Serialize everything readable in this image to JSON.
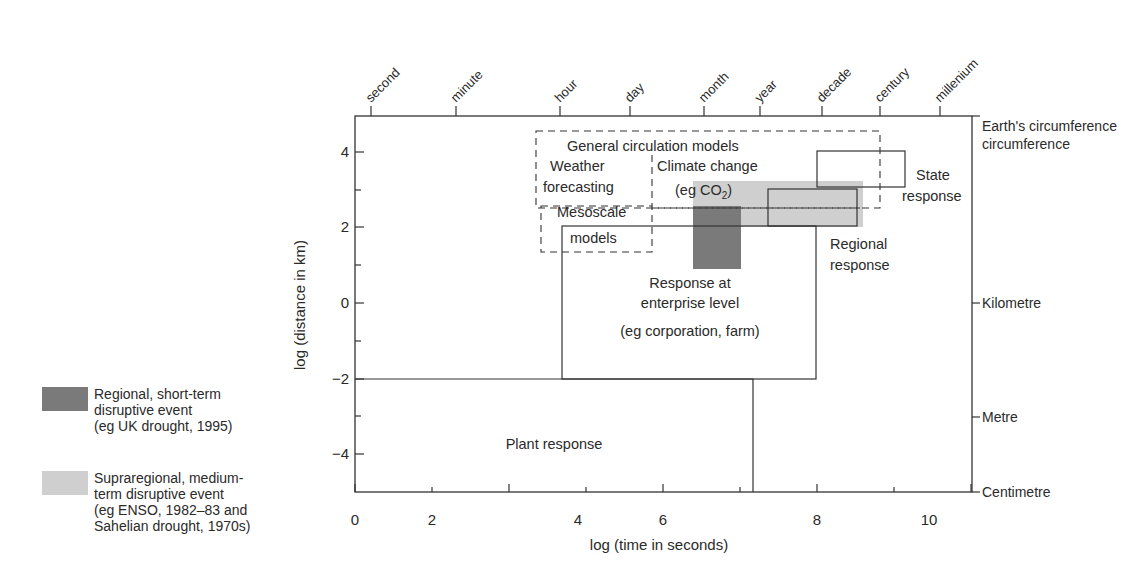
{
  "diagram": {
    "type": "scale-diagram",
    "x_axis": {
      "label": "log (time in seconds)",
      "ticks": [
        "0",
        "2",
        "4",
        "6",
        "8",
        "10"
      ],
      "top_labels": [
        "second",
        "minute",
        "hour",
        "day",
        "month",
        "year",
        "decade",
        "century",
        "millenium"
      ]
    },
    "y_axis": {
      "label": "log (distance in km)",
      "ticks": [
        "4",
        "2",
        "0",
        "−2",
        "−4"
      ],
      "right_labels": [
        "Earth's circumference",
        "Kilometre",
        "Metre",
        "Centimetre"
      ]
    },
    "regions": {
      "gcm": "General circulation models",
      "climate_change_1": "Climate change",
      "climate_change_2": "(eg CO",
      "climate_change_sub": "2",
      "climate_change_3": ")",
      "weather_1": "Weather",
      "weather_2": "forecasting",
      "mesoscale_1": "Mesoscale",
      "mesoscale_2": "models",
      "state_1": "State",
      "state_2": "response",
      "regional_1": "Regional",
      "regional_2": "response",
      "enterprise_1": "Response at",
      "enterprise_2": "enterprise level",
      "enterprise_3": "(eg corporation, farm)",
      "plant": "Plant response"
    },
    "legend": [
      {
        "label": "Regional, short-term\ndisruptive event\n(eg UK drought, 1995)",
        "color": "#7a7a7a"
      },
      {
        "label": "Supraregional, medium-\nterm disruptive event\n(eg ENSO, 1982–83 and\nSahelian drought, 1970s)",
        "color": "#cfcfcf"
      }
    ]
  }
}
